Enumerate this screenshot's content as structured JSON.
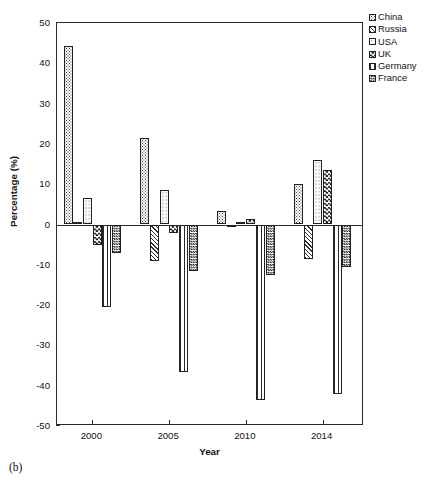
{
  "caption": "(b)",
  "chart_data": {
    "type": "bar",
    "title": "",
    "subtitle": "",
    "xlabel": "Year",
    "ylabel": "Percentage (%)",
    "categories": [
      "2000",
      "2005",
      "2010",
      "2014"
    ],
    "ylim": [
      -50,
      50
    ],
    "yticks": [
      50,
      40,
      30,
      20,
      10,
      0,
      -10,
      -20,
      -30,
      -40,
      -50
    ],
    "ytick_labels": [
      "50",
      "40",
      "30",
      "20",
      "10",
      "0",
      "-10",
      "-20",
      "-30",
      "-40",
      "-50"
    ],
    "grid": false,
    "legend_position": "top-right-outside",
    "series": [
      {
        "name": "China",
        "pattern": "fine-dots",
        "color": "#d8d8d8",
        "values": [
          44.2,
          21.4,
          3.4,
          10.0
        ]
      },
      {
        "name": "Russia",
        "pattern": "diagonal-hatch",
        "color": "#808080",
        "values": [
          0.5,
          -9.0,
          -0.6,
          -8.6
        ]
      },
      {
        "name": "USA",
        "pattern": "sparse-dots",
        "color": "#ececec",
        "values": [
          6.5,
          8.5,
          0.5,
          15.9
        ]
      },
      {
        "name": "UK",
        "pattern": "checkerboard",
        "color": "#555555",
        "values": [
          -5.0,
          -2.2,
          1.4,
          13.5
        ]
      },
      {
        "name": "Germany",
        "pattern": "vertical-lines",
        "color": "#bfbfbf",
        "values": [
          -20.5,
          -36.5,
          -43.5,
          -42.0
        ]
      },
      {
        "name": "France",
        "pattern": "dense-crosshatch",
        "color": "#909090",
        "values": [
          -7.0,
          -11.5,
          -12.5,
          -10.5
        ]
      }
    ]
  },
  "legend": {
    "items": [
      {
        "label": "China"
      },
      {
        "label": "Russia"
      },
      {
        "label": "USA"
      },
      {
        "label": "UK"
      },
      {
        "label": "Germany"
      },
      {
        "label": "France"
      }
    ]
  }
}
